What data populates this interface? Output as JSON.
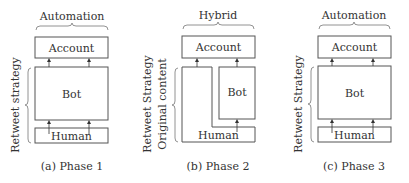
{
  "panels": [
    {
      "top_label": "Automation",
      "side_labels": [
        "Retweet strategy"
      ],
      "boxes": {
        "account": "Account",
        "bot": "Bot",
        "human": "Human"
      },
      "caption": "(a) Phase 1"
    },
    {
      "top_label": "Hybrid",
      "side_labels": [
        "Retweet Strategy",
        "Original content"
      ],
      "boxes": {
        "account": "Account",
        "bot": "Bot",
        "human": "Human"
      },
      "caption": "(b) Phase 2"
    },
    {
      "top_label": "Automation",
      "side_labels": [
        "Retweet Strategy"
      ],
      "boxes": {
        "account": "Account",
        "bot": "Bot",
        "human": "Human"
      },
      "caption": "(c) Phase 3"
    }
  ],
  "colors": {
    "stroke": "#555555",
    "text": "#333333"
  }
}
